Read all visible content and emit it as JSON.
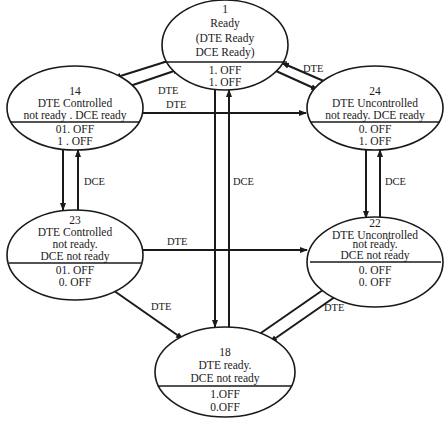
{
  "diagram": {
    "type": "state-transition",
    "states": [
      {
        "id": "1",
        "number": "1",
        "lines": [
          "Ready",
          "(DTE Ready",
          "DCE Ready)"
        ],
        "outputs": [
          "1. OFF",
          "1. OFF"
        ]
      },
      {
        "id": "14",
        "number": "14",
        "lines": [
          "DTE Controlled",
          "not ready . DCE ready"
        ],
        "outputs": [
          "01. OFF",
          "1 . OFF"
        ]
      },
      {
        "id": "24",
        "number": "24",
        "lines": [
          "DTE Uncontrolled",
          "not ready. DCE ready"
        ],
        "outputs": [
          "0. OFF",
          "1. OFF"
        ]
      },
      {
        "id": "23",
        "number": "23",
        "lines": [
          "DTE Controlled",
          "not ready.",
          "DCE not ready"
        ],
        "outputs": [
          "01. OFF",
          "0. OFF"
        ]
      },
      {
        "id": "22",
        "number": "22",
        "lines": [
          "DTE Uncontrolled",
          "not ready.",
          "DCE not ready"
        ],
        "outputs": [
          "0. OFF",
          "0. OFF"
        ]
      },
      {
        "id": "18",
        "number": "18",
        "lines": [
          "DTE ready.",
          "DCE not ready"
        ],
        "outputs": [
          "1.OFF",
          "0.OFF"
        ]
      }
    ],
    "edge_labels": {
      "e_1_14": "DTE",
      "e_14_24": "DTE",
      "e_1_24": "DTE",
      "e_14_23": "DCE",
      "e_1_18": "DCE",
      "e_24_22": "DCE",
      "e_23_22": "DTE",
      "e_23_18": "DTE",
      "e_18_22": "DTE"
    },
    "edges": [
      {
        "from": "1",
        "to": "14",
        "label": "DTE"
      },
      {
        "from": "14",
        "to": "1",
        "label": ""
      },
      {
        "from": "14",
        "to": "24",
        "label": "DTE"
      },
      {
        "from": "24",
        "to": "1",
        "label": "DTE"
      },
      {
        "from": "1",
        "to": "24",
        "label": ""
      },
      {
        "from": "14",
        "to": "23",
        "label": ""
      },
      {
        "from": "23",
        "to": "14",
        "label": "DCE"
      },
      {
        "from": "1",
        "to": "18",
        "label": ""
      },
      {
        "from": "18",
        "to": "1",
        "label": "DCE"
      },
      {
        "from": "24",
        "to": "22",
        "label": ""
      },
      {
        "from": "22",
        "to": "24",
        "label": "DCE"
      },
      {
        "from": "23",
        "to": "22",
        "label": "DTE"
      },
      {
        "from": "23",
        "to": "18",
        "label": "DTE"
      },
      {
        "from": "18",
        "to": "22",
        "label": "DTE"
      },
      {
        "from": "22",
        "to": "18",
        "label": ""
      }
    ],
    "colors": {
      "ink": "#1a1a1a",
      "background": "#ffffff"
    }
  }
}
